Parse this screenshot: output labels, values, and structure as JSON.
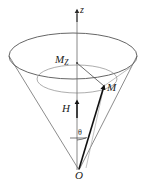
{
  "figure": {
    "colors": {
      "stroke": "#3a3a3a",
      "cone_stroke": "#6b6b6b",
      "vector_stroke": "#141414",
      "axis_stroke": "#555555",
      "background": "#ffffff",
      "label": "#1a1a1a"
    },
    "labels": {
      "z_axis": "z",
      "m_z": "M",
      "m_z_sub": "Z",
      "m_vector": "M",
      "h_field": "H",
      "theta_angle": "θ",
      "origin": "O"
    },
    "geometry": {
      "apex": {
        "x": 79,
        "y": 170
      },
      "ellipse_center": {
        "x": 73,
        "y": 56
      },
      "ellipse_rx": 64,
      "ellipse_ry": 23,
      "m_point": {
        "x": 104,
        "y": 86
      },
      "mz_point": {
        "x": 77,
        "y": 63
      },
      "axis_top": {
        "x": 77,
        "y": 10
      },
      "h_arrow_top": {
        "x": 77,
        "y": 101
      },
      "h_arrow_bottom": {
        "x": 77,
        "y": 118
      },
      "theta_arc_radius": 30
    }
  }
}
